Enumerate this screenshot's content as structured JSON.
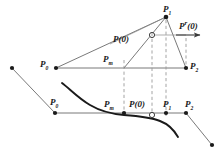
{
  "figure": {
    "background_color": "#ffffff",
    "line_color": "#5a5a5a",
    "dash_color": "#8c8c8c",
    "curve_color": "#1a1a1a",
    "point_color": "#1a1a1a",
    "label_color": "#1a1a1a",
    "width": 219,
    "height": 152
  },
  "labels": {
    "upper_p0": {
      "base": "P",
      "sub": "0",
      "prime": "",
      "suffix": ""
    },
    "upper_p1": {
      "base": "P",
      "sub": "1",
      "prime": "",
      "suffix": ""
    },
    "upper_p2": {
      "base": "P",
      "sub": "2",
      "prime": "",
      "suffix": ""
    },
    "upper_pm": {
      "base": "P",
      "sub": "m",
      "prime": "",
      "suffix": ""
    },
    "upper_p_of_0": {
      "base": "P",
      "sub": "",
      "prime": "",
      "suffix": "(0)"
    },
    "tangent": {
      "base": "P",
      "sub": "",
      "prime": "r",
      "suffix": "(0)"
    },
    "lower_p0": {
      "base": "P",
      "sub": "0",
      "prime": "",
      "suffix": ""
    },
    "lower_pm": {
      "base": "P",
      "sub": "m",
      "prime": "",
      "suffix": ""
    },
    "lower_p_of_0": {
      "base": "P",
      "sub": "",
      "prime": "",
      "suffix": "(0)"
    },
    "lower_p1": {
      "base": "P",
      "sub": "1",
      "prime": "",
      "suffix": ""
    },
    "lower_p2": {
      "base": "P",
      "sub": "2",
      "prime": "",
      "suffix": ""
    }
  },
  "geometry": {
    "upper": {
      "p0": {
        "x": 56,
        "y": 68
      },
      "p1": {
        "x": 166,
        "y": 17
      },
      "p2": {
        "x": 186,
        "y": 68
      },
      "pm": {
        "x": 124,
        "y": 68
      },
      "p_of_0": {
        "x": 152,
        "y": 35
      },
      "baseline_start": {
        "x": 56,
        "y": 68
      },
      "baseline_end": {
        "x": 186,
        "y": 68
      },
      "tangent_arrow_start": {
        "x": 152,
        "y": 35
      },
      "tangent_arrow_end": {
        "x": 198,
        "y": 35
      }
    },
    "lower": {
      "p_minus1": {
        "x": 12,
        "y": 68
      },
      "p0": {
        "x": 55,
        "y": 113
      },
      "pm": {
        "x": 124,
        "y": 113
      },
      "p_of_0": {
        "x": 152,
        "y": 113
      },
      "p1": {
        "x": 166,
        "y": 113
      },
      "p2": {
        "x": 186,
        "y": 113
      },
      "p3": {
        "x": 212,
        "y": 145
      },
      "baseline_start": {
        "x": 55,
        "y": 113
      },
      "baseline_end": {
        "x": 186,
        "y": 113
      }
    },
    "dashed_verticals": [
      {
        "x": 124,
        "y_top": 68,
        "y_bottom": 113
      },
      {
        "x": 152,
        "y_top": 35,
        "y_bottom": 113
      },
      {
        "x": 166,
        "y_top": 17,
        "y_bottom": 113
      }
    ]
  },
  "markers": {
    "filled_points_upper": 4,
    "open_points_upper": 1,
    "filled_points_lower": 6,
    "open_points_lower": 1
  }
}
